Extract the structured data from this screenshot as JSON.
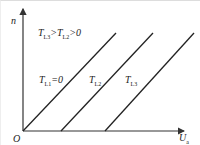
{
  "diagram": {
    "axes": {
      "y_label": "n",
      "x_label": "U",
      "x_label_sub": "a",
      "origin_label": "O"
    },
    "condition": {
      "text_pre": "T",
      "sub1": "L3",
      "mid": ">T",
      "sub2": "L2",
      "post": ">0"
    },
    "curves": [
      {
        "label": "T",
        "sub": "L1",
        "suffix": "=0",
        "x0": 22,
        "y0": 130,
        "x1": 115,
        "y1": 32
      },
      {
        "label": "T",
        "sub": "L2",
        "suffix": "",
        "x0": 60,
        "y0": 130,
        "x1": 152,
        "y1": 32
      },
      {
        "label": "T",
        "sub": "L3",
        "suffix": "",
        "x0": 104,
        "y0": 130,
        "x1": 193,
        "y1": 32
      }
    ],
    "colors": {
      "line": "#222222",
      "axis": "#333333"
    }
  }
}
